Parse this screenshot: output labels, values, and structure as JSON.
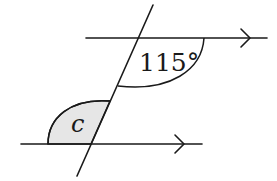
{
  "diagram": {
    "type": "parallel-lines-transversal",
    "angles": {
      "known": {
        "label": "115°",
        "value_degrees": 115
      },
      "unknown": {
        "label": "c",
        "shaded": true
      }
    },
    "lines": {
      "upper_parallel": {
        "has_arrow": true
      },
      "lower_parallel": {
        "has_arrow": true
      },
      "transversal": {
        "has_arrow": false
      }
    },
    "colors": {
      "stroke": "#1a1a1a",
      "shade": "#e6e6e6",
      "background": "#ffffff"
    }
  }
}
